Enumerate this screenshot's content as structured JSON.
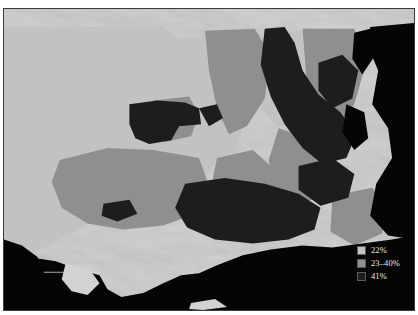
{
  "map": {
    "title_mark": "",
    "palette": {
      "water": "#050505",
      "terrain_base": "#c6c6c6",
      "class_low": "#c2c2c2",
      "class_mid": "#8f8f8f",
      "class_high": "#1d1d1d",
      "frame": "#3b3b3b",
      "legend_text": "#e8e8e8"
    }
  },
  "legend": {
    "items": [
      {
        "label": "22%",
        "color": "#c2c2c2",
        "swatch_name": "legend-swatch-low"
      },
      {
        "label": "23–40%",
        "color": "#8f8f8f",
        "swatch_name": "legend-swatch-mid"
      },
      {
        "label": "41%",
        "color": "#1d1d1d",
        "swatch_name": "legend-swatch-high"
      }
    ]
  }
}
